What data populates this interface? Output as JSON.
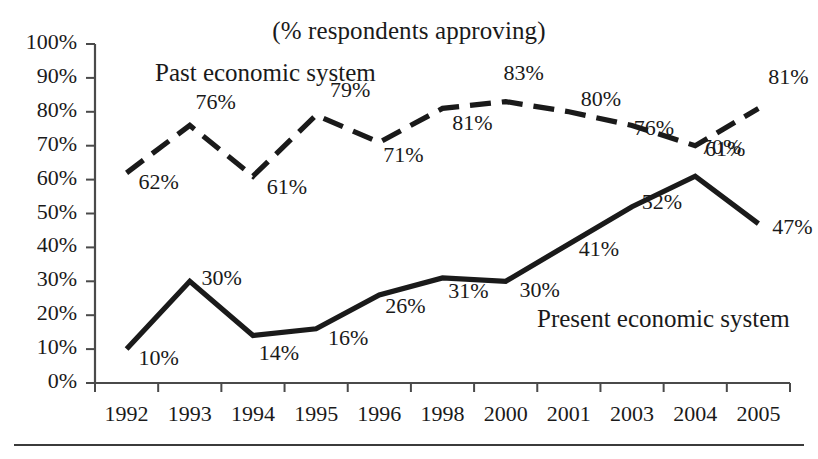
{
  "chart_data": {
    "type": "line",
    "title": "(% respondents approving)",
    "xlabel": "",
    "ylabel": "",
    "ylim": [
      0,
      100
    ],
    "grid": false,
    "legend_position": "inline-annotation",
    "categories": [
      "1992",
      "1993",
      "1994",
      "1995",
      "1996",
      "1998",
      "2000",
      "2001",
      "2003",
      "2004",
      "2005"
    ],
    "ytick_labels": [
      "100%",
      "90%",
      "80%",
      "70%",
      "60%",
      "50%",
      "40%",
      "30%",
      "20%",
      "10%",
      "0%"
    ],
    "ytick_values": [
      100,
      90,
      80,
      70,
      60,
      50,
      40,
      30,
      20,
      10,
      0
    ],
    "series": [
      {
        "name": "Past economic system",
        "style": "dashed",
        "color": "#1a1a1a",
        "values": [
          62,
          76,
          61,
          79,
          71,
          81,
          83,
          80,
          76,
          70,
          81
        ],
        "value_labels": [
          "62%",
          "76%",
          "61%",
          "79%",
          "71%",
          "81%",
          "83%",
          "80%",
          "76%",
          "70%",
          "81%"
        ]
      },
      {
        "name": "Present economic system",
        "style": "solid",
        "color": "#1a1a1a",
        "values": [
          10,
          30,
          14,
          16,
          26,
          31,
          30,
          41,
          52,
          61,
          47
        ],
        "value_labels": [
          "10%",
          "30%",
          "14%",
          "16%",
          "26%",
          "31%",
          "30%",
          "41%",
          "52%",
          "61%",
          "47%"
        ]
      }
    ]
  },
  "annotations": {
    "past_label": "Past economic system",
    "present_label": "Present economic system"
  },
  "axes": {
    "axis_color": "#4a4a4a"
  }
}
